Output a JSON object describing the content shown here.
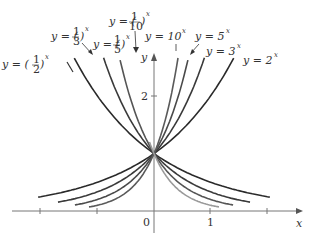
{
  "chart_data": {
    "type": "line",
    "title": "",
    "xlabel": "x",
    "ylabel": "y",
    "xlim": [
      -2.5,
      2.6
    ],
    "ylim": [
      -0.4,
      2.7
    ],
    "x_ticks": [
      -2,
      -1,
      0,
      1,
      2
    ],
    "x_tick_labels": {
      "0": "0",
      "1": "1"
    },
    "y_ticks": [
      2
    ],
    "y_tick_labels": {
      "2": "2"
    },
    "grid": false,
    "legend": "inline labels with arrows",
    "series": [
      {
        "name": "y = 2^x",
        "base": 2,
        "color": "#2a2a2a",
        "label": "y = 2",
        "exp": "x"
      },
      {
        "name": "y = 3^x",
        "base": 3,
        "color": "#3a3a3a",
        "label": "y = 3",
        "exp": "x"
      },
      {
        "name": "y = 5^x",
        "base": 5,
        "color": "#4a4a4a",
        "label": "y = 5",
        "exp": "x"
      },
      {
        "name": "y = 10^x",
        "base": 10,
        "color": "#5a5a5a",
        "label": "y = 10",
        "exp": "x"
      },
      {
        "name": "y = (1/2)^x",
        "base": 0.5,
        "color": "#2a2a2a",
        "label": "y = (1/2)",
        "exp": "x"
      },
      {
        "name": "y = (1/3)^x",
        "base": 0.3333,
        "color": "#3a3a3a",
        "label": "y = (1/3)",
        "exp": "x"
      },
      {
        "name": "y = (1/5)^x",
        "base": 0.2,
        "color": "#555555",
        "label": "y = (1/5)",
        "exp": "x"
      },
      {
        "name": "y = (1/10)^x",
        "base": 0.1,
        "color": "#9a9a9a",
        "label": "y = (1/10)",
        "exp": "x"
      }
    ],
    "annotations": [
      "All curves pass through (0, 1)"
    ]
  }
}
